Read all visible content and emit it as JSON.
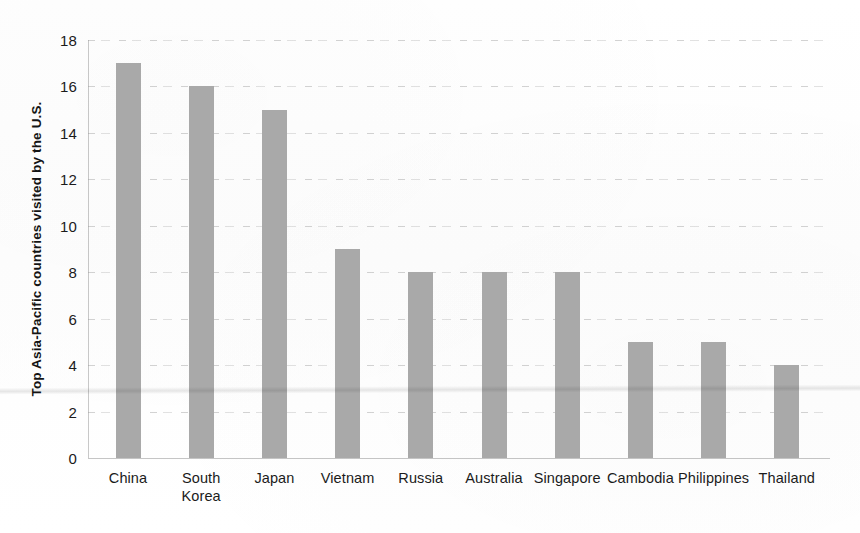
{
  "chart_data": {
    "type": "bar",
    "title": "",
    "subtitle": "",
    "xlabel": "",
    "ylabel": "Top Asia-Pacific countries visited by the U.S.",
    "categories": [
      "China",
      "South\nKorea",
      "Japan",
      "Vietnam",
      "Russia",
      "Australia",
      "Singapore",
      "Cambodia",
      "Philippines",
      "Thailand"
    ],
    "values": [
      17,
      16,
      15,
      9,
      8,
      8,
      8,
      5,
      5,
      4
    ],
    "ylim": [
      0,
      18
    ],
    "ytick_labels": [
      "0",
      "2",
      "4",
      "6",
      "8",
      "10",
      "12",
      "14",
      "16",
      "18"
    ],
    "ytick_values": [
      0,
      2,
      4,
      6,
      8,
      10,
      12,
      14,
      16,
      18
    ],
    "grid": true,
    "grid_axis": "y",
    "legend": false,
    "legend_position": "none",
    "bar_color": "#a9a9a9",
    "grid_color": "#cfcfcf",
    "axis_color": "#8a8a8a",
    "text_color": "#1b1b1b",
    "background_color": "#ffffff"
  },
  "artifacts": {
    "fold_line_label": "scan-fold-line"
  }
}
